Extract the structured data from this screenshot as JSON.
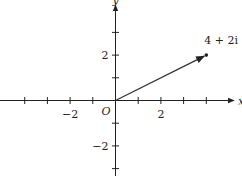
{
  "diagram": {
    "type": "complex-plane",
    "x_axis_label": "x",
    "y_axis_label": "y",
    "origin_label": "O",
    "x_range": [
      -5,
      5
    ],
    "y_range": [
      -3,
      4
    ],
    "x_ticks": [
      -4,
      -3,
      -2,
      -1,
      1,
      2,
      3,
      4
    ],
    "y_ticks": [
      -3,
      -2,
      -1,
      1,
      2,
      3
    ],
    "x_tick_labels": [
      {
        "value": -2,
        "text": "−2"
      },
      {
        "value": 2,
        "text": "2"
      }
    ],
    "y_tick_labels": [
      {
        "value": 2,
        "text": "2"
      },
      {
        "value": -2,
        "text": "−2"
      }
    ],
    "vector": {
      "from": [
        0,
        0
      ],
      "to": [
        4,
        2
      ],
      "label": "4 + 2i"
    },
    "colors": {
      "axis": "#222222",
      "vector": "#333333"
    }
  }
}
